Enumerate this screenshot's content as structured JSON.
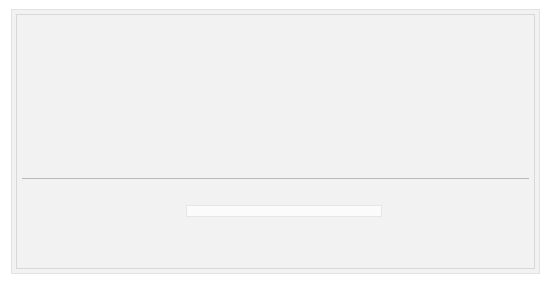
{
  "chart_data": {
    "type": "bar",
    "subtype": "stacked-vertical",
    "title": "",
    "subtitle": "",
    "xlabel": "",
    "ylabel": "",
    "ylim": [
      0,
      3.35
    ],
    "grid": false,
    "legend_position": "bottom-center",
    "categories": [
      "2006",
      "2007",
      "2008",
      "2009",
      "2010",
      "2011",
      "2012",
      "2013",
      "2014",
      "2015",
      "2016",
      "2017",
      "2018",
      "2019",
      "2020"
    ],
    "series": [
      {
        "name": "Dual eligibles",
        "color": "#4f6170",
        "stack_position": "bottom",
        "values": [
          0.44,
          0.75,
          0.85,
          0.9,
          0.97,
          1.05,
          1.16,
          1.34,
          1.54,
          1.66,
          1.76,
          1.92,
          2.16,
          2.49,
          2.88
        ]
      },
      {
        "name": "Chronic or disabling conditions",
        "color": "#9aa5ad",
        "stack_position": "middle",
        "values": [
          0.07,
          0.18,
          0.2,
          0.25,
          0.2,
          0.15,
          0.19,
          0.25,
          0.28,
          0.31,
          0.33,
          0.33,
          0.35,
          0.35,
          0.37
        ]
      },
      {
        "name": "Institutional",
        "color": "#3b4a54",
        "stack_position": "top",
        "values": [
          0.02,
          0.14,
          0.13,
          0.12,
          0.08,
          0.08,
          0.05,
          0.05,
          0.05,
          0.05,
          0.06,
          0.06,
          0.07,
          0.08,
          0.1
        ]
      }
    ],
    "totals": [
      0.53,
      1.08,
      1.19,
      1.27,
      1.26,
      1.28,
      1.4,
      1.64,
      1.87,
      2.01,
      2.14,
      2.31,
      2.58,
      2.92,
      3.35
    ],
    "total_labels": [
      "0.53",
      "1.08",
      "1.19",
      "1.27",
      "1.26",
      "1.28",
      "1.40",
      "1.64",
      "1.87",
      "2.01",
      "2.14",
      "2.31",
      "2.58",
      "2.92",
      "3.35"
    ],
    "segment_labels": {
      "institutional": [
        "0.02",
        "0.14",
        "0.13",
        "0.12",
        "0.08",
        "0.08",
        "0.05",
        "0.05",
        "0.05",
        "0.05",
        "0.06",
        "0.06",
        "0.07",
        "0.08",
        "0.10"
      ],
      "chronic": [
        "0.07",
        "0.18",
        "0.20",
        "0.25",
        "0.20",
        "0.15",
        "0.19",
        "0.25",
        "0.28",
        "0.31",
        "0.33",
        "0.33",
        "0.35",
        "0.35",
        "0.37"
      ],
      "dual": [
        "0.44",
        "0.75",
        "0.85",
        "0.90",
        "0.97",
        "1.05",
        "1.16",
        "1.34",
        "1.54",
        "1.66",
        "1.76",
        "1.92",
        "2.16",
        "2.49",
        "2.88"
      ]
    }
  },
  "legend": {
    "items": [
      {
        "label": "Institutional",
        "key": "inst"
      },
      {
        "label": "Chronic or disabling conditions",
        "key": "chronic"
      },
      {
        "label": "Dual eligibles",
        "key": "dual"
      }
    ]
  },
  "colors": {
    "institutional": "#3b4a54",
    "chronic": "#9aa5ad",
    "dual": "#4f6170",
    "panel_background": "#f2f2f2",
    "page_background": "#ffffff"
  }
}
